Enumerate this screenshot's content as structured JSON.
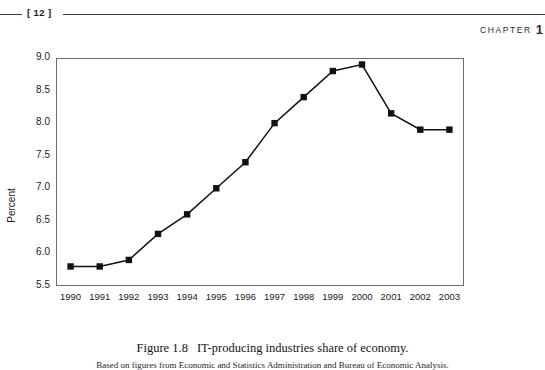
{
  "header": {
    "folio": "[ 12 ]",
    "chapter_label": "CHAPTER",
    "chapter_number": "1"
  },
  "caption": {
    "figure_number": "Figure 1.8",
    "figure_title": "IT-producing industries share of economy.",
    "source_note": "Based on figures from Economic and Statistics Administration and Bureau of Economic Analysis."
  },
  "chart_data": {
    "type": "line",
    "title": "",
    "xlabel": "",
    "ylabel": "Percent",
    "ylim": [
      5.5,
      9.0
    ],
    "ytick_step": 0.5,
    "ytick_labels": [
      "9.0",
      "8.5",
      "8.0",
      "7.5",
      "7.0",
      "6.5",
      "6.0",
      "5.5"
    ],
    "grid": false,
    "legend": "none",
    "marker": "square",
    "line_color": "#111111",
    "marker_color": "#111111",
    "frame_color": "#6b6b6b",
    "categories": [
      "1990",
      "1991",
      "1992",
      "1993",
      "1994",
      "1995",
      "1996",
      "1997",
      "1998",
      "1999",
      "2000",
      "2001",
      "2002",
      "2003"
    ],
    "values": [
      5.8,
      5.8,
      5.9,
      6.3,
      6.6,
      7.0,
      7.4,
      8.0,
      8.4,
      8.8,
      8.9,
      8.15,
      7.9,
      7.9
    ]
  }
}
